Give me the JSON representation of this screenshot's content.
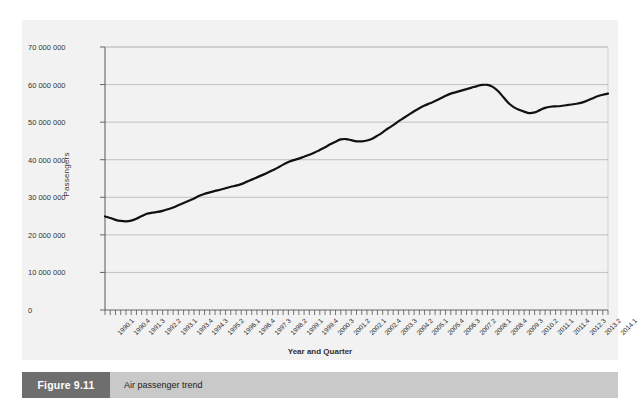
{
  "figure": {
    "number_label": "Figure 9.11",
    "caption": "Air passenger trend",
    "number_box_color": "#6e6e6e",
    "caption_bar_color": "#c9c9c9"
  },
  "chart_data": {
    "type": "line",
    "title": "",
    "xlabel": "Year and Quarter",
    "ylabel": "Passengers",
    "ylim": [
      0,
      70000000
    ],
    "ytick_labels": [
      "0",
      "10 000 000",
      "20 000 000",
      "30 000 000",
      "40 000 000",
      "50 000 000",
      "60 000 000",
      "70 000 000"
    ],
    "ytick_values": [
      0,
      10000000,
      20000000,
      30000000,
      40000000,
      50000000,
      60000000,
      70000000
    ],
    "grid": true,
    "grid_color": "#b4b4b4",
    "legend": false,
    "plot_background": "#f2f2f2",
    "line_color": "#111111",
    "line_width": 2.2,
    "xtick_labels": [
      "1990.1",
      "1990.4",
      "1991.3",
      "1992.2",
      "1993.1",
      "1993.4",
      "1994.3",
      "1995.2",
      "1996.1",
      "1996.4",
      "1997.3",
      "1998.2",
      "1999.1",
      "1999.4",
      "2000.3",
      "2001.2",
      "2002.1",
      "2002.4",
      "2003.3",
      "2004.2",
      "2005.1",
      "2005.4",
      "2006.3",
      "2007.2",
      "2008.1",
      "2008.4",
      "2009.3",
      "2010.2",
      "2011.1",
      "2011.4",
      "2012.3",
      "2013.2",
      "2014.1"
    ],
    "xtick_label_interval": 3,
    "categories": [
      "1990.1",
      "1990.2",
      "1990.3",
      "1990.4",
      "1991.1",
      "1991.2",
      "1991.3",
      "1991.4",
      "1992.1",
      "1992.2",
      "1992.3",
      "1992.4",
      "1993.1",
      "1993.2",
      "1993.3",
      "1993.4",
      "1994.1",
      "1994.2",
      "1994.3",
      "1994.4",
      "1995.1",
      "1995.2",
      "1995.3",
      "1995.4",
      "1996.1",
      "1996.2",
      "1996.3",
      "1996.4",
      "1997.1",
      "1997.2",
      "1997.3",
      "1997.4",
      "1998.1",
      "1998.2",
      "1998.3",
      "1998.4",
      "1999.1",
      "1999.2",
      "1999.3",
      "1999.4",
      "2000.1",
      "2000.2",
      "2000.3",
      "2000.4",
      "2001.1",
      "2001.2",
      "2001.3",
      "2001.4",
      "2002.1",
      "2002.2",
      "2002.3",
      "2002.4",
      "2003.1",
      "2003.2",
      "2003.3",
      "2003.4",
      "2004.1",
      "2004.2",
      "2004.3",
      "2004.4",
      "2005.1",
      "2005.2",
      "2005.3",
      "2005.4",
      "2006.1",
      "2006.2",
      "2006.3",
      "2006.4",
      "2007.1",
      "2007.2",
      "2007.3",
      "2007.4",
      "2008.1",
      "2008.2",
      "2008.3",
      "2008.4",
      "2009.1",
      "2009.2",
      "2009.3",
      "2009.4",
      "2010.1",
      "2010.2",
      "2010.3",
      "2010.4",
      "2011.1",
      "2011.2",
      "2011.3",
      "2011.4",
      "2012.1",
      "2012.2",
      "2012.3",
      "2012.4",
      "2013.1",
      "2013.2",
      "2013.3",
      "2013.4",
      "2014.1"
    ],
    "values": [
      24900000,
      24500000,
      24000000,
      23700000,
      23600000,
      23800000,
      24300000,
      25000000,
      25600000,
      25900000,
      26100000,
      26400000,
      26800000,
      27300000,
      27900000,
      28500000,
      29100000,
      29700000,
      30400000,
      30900000,
      31300000,
      31700000,
      32000000,
      32400000,
      32800000,
      33100000,
      33500000,
      34100000,
      34700000,
      35300000,
      35900000,
      36500000,
      37200000,
      37900000,
      38700000,
      39400000,
      39900000,
      40300000,
      40800000,
      41300000,
      41900000,
      42600000,
      43300000,
      44100000,
      44800000,
      45400000,
      45500000,
      45200000,
      44900000,
      44900000,
      45100000,
      45600000,
      46400000,
      47300000,
      48300000,
      49200000,
      50200000,
      51100000,
      52000000,
      52900000,
      53700000,
      54400000,
      55000000,
      55600000,
      56300000,
      57000000,
      57600000,
      58000000,
      58400000,
      58800000,
      59200000,
      59600000,
      59900000,
      59900000,
      59400000,
      58300000,
      56700000,
      55100000,
      54000000,
      53300000,
      52800000,
      52400000,
      52600000,
      53200000,
      53800000,
      54100000,
      54200000,
      54300000,
      54500000,
      54700000,
      54900000,
      55200000,
      55700000,
      56300000,
      56900000,
      57300000,
      57600000
    ]
  }
}
